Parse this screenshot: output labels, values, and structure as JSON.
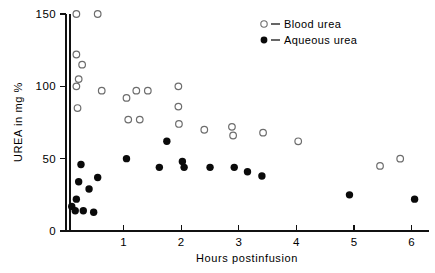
{
  "chart_data": {
    "type": "scatter",
    "title": "",
    "xlabel": "Hours postinfusion",
    "ylabel": "UREA in mg %",
    "xlim": [
      0,
      6.3
    ],
    "ylim": [
      0,
      150
    ],
    "xticks": [
      1,
      2,
      3,
      4,
      5,
      6
    ],
    "xtick_labels": [
      "1",
      "2",
      "3",
      "4",
      "5",
      "6"
    ],
    "yticks": [
      0,
      50,
      100,
      150
    ],
    "ytick_labels": [
      "0",
      "50",
      "100",
      "150"
    ],
    "grid": false,
    "legend_position": "top-right",
    "series": [
      {
        "name": "Blood urea",
        "marker": "open-circle",
        "color": "#6d6d6d",
        "points": [
          {
            "x": 0.18,
            "y": 150
          },
          {
            "x": 0.18,
            "y": 122
          },
          {
            "x": 0.28,
            "y": 115
          },
          {
            "x": 0.22,
            "y": 105
          },
          {
            "x": 0.18,
            "y": 100
          },
          {
            "x": 0.2,
            "y": 85
          },
          {
            "x": 0.55,
            "y": 150
          },
          {
            "x": 0.62,
            "y": 97
          },
          {
            "x": 1.05,
            "y": 92
          },
          {
            "x": 1.22,
            "y": 97
          },
          {
            "x": 1.42,
            "y": 97
          },
          {
            "x": 1.08,
            "y": 77
          },
          {
            "x": 1.28,
            "y": 77
          },
          {
            "x": 1.95,
            "y": 100
          },
          {
            "x": 1.95,
            "y": 86
          },
          {
            "x": 1.96,
            "y": 74
          },
          {
            "x": 2.4,
            "y": 70
          },
          {
            "x": 2.88,
            "y": 72
          },
          {
            "x": 2.9,
            "y": 66
          },
          {
            "x": 3.42,
            "y": 68
          },
          {
            "x": 4.03,
            "y": 62
          },
          {
            "x": 5.45,
            "y": 45
          },
          {
            "x": 5.8,
            "y": 50
          }
        ]
      },
      {
        "name": "Aqueous urea",
        "marker": "filled-circle",
        "color": "#0a0a0a",
        "points": [
          {
            "x": 0.1,
            "y": 17
          },
          {
            "x": 0.16,
            "y": 14
          },
          {
            "x": 0.18,
            "y": 22
          },
          {
            "x": 0.22,
            "y": 34
          },
          {
            "x": 0.26,
            "y": 46
          },
          {
            "x": 0.3,
            "y": 14
          },
          {
            "x": 0.4,
            "y": 29
          },
          {
            "x": 0.48,
            "y": 13
          },
          {
            "x": 0.55,
            "y": 37
          },
          {
            "x": 1.05,
            "y": 50
          },
          {
            "x": 1.62,
            "y": 44
          },
          {
            "x": 1.75,
            "y": 62
          },
          {
            "x": 2.02,
            "y": 48
          },
          {
            "x": 2.05,
            "y": 44
          },
          {
            "x": 2.5,
            "y": 44
          },
          {
            "x": 2.92,
            "y": 44
          },
          {
            "x": 3.15,
            "y": 41
          },
          {
            "x": 3.4,
            "y": 38
          },
          {
            "x": 4.92,
            "y": 25
          },
          {
            "x": 6.05,
            "y": 22
          }
        ]
      }
    ]
  },
  "legend": {
    "entries": [
      {
        "marker": "open-circle",
        "dash": "–",
        "label": "Blood urea"
      },
      {
        "marker": "filled-circle",
        "dash": "–",
        "label": "Aqueous urea"
      }
    ]
  }
}
